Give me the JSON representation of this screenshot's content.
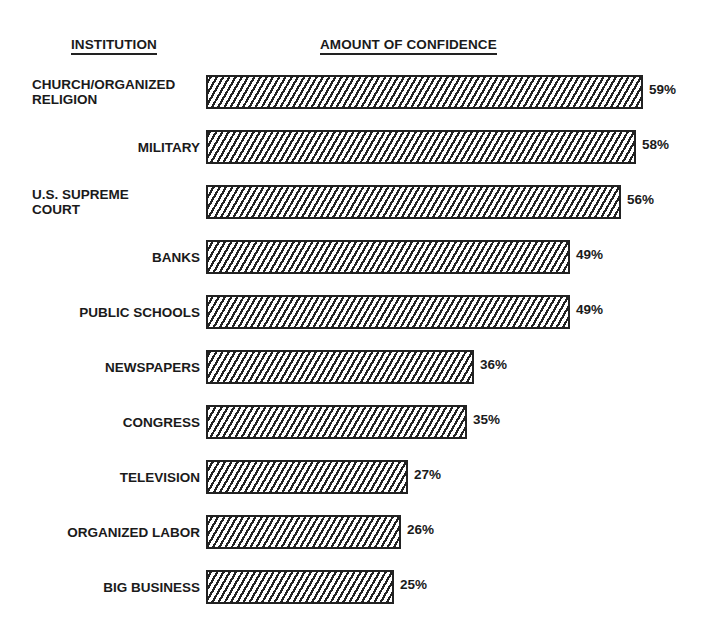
{
  "headers": {
    "institution": "INSTITUTION",
    "amount": "AMOUNT OF CONFIDENCE"
  },
  "rows": [
    {
      "label_lines": [
        "CHURCH/ORGANIZED",
        "RELIGION"
      ],
      "value": 59,
      "value_label": "59%"
    },
    {
      "label_lines": [
        "MILITARY"
      ],
      "value": 58,
      "value_label": "58%"
    },
    {
      "label_lines": [
        "U.S. SUPREME",
        "COURT"
      ],
      "value": 56,
      "value_label": "56%"
    },
    {
      "label_lines": [
        "BANKS"
      ],
      "value": 49,
      "value_label": "49%"
    },
    {
      "label_lines": [
        "PUBLIC SCHOOLS"
      ],
      "value": 49,
      "value_label": "49%"
    },
    {
      "label_lines": [
        "NEWSPAPERS"
      ],
      "value": 36,
      "value_label": "36%"
    },
    {
      "label_lines": [
        "CONGRESS"
      ],
      "value": 35,
      "value_label": "35%"
    },
    {
      "label_lines": [
        "TELEVISION"
      ],
      "value": 27,
      "value_label": "27%"
    },
    {
      "label_lines": [
        "ORGANIZED LABOR"
      ],
      "value": 26,
      "value_label": "26%"
    },
    {
      "label_lines": [
        "BIG BUSINESS"
      ],
      "value": 25,
      "value_label": "25%"
    }
  ],
  "chart_data": {
    "type": "bar",
    "orientation": "horizontal",
    "title": "",
    "xlabel": "AMOUNT OF CONFIDENCE",
    "ylabel": "INSTITUTION",
    "categories": [
      "CHURCH/ORGANIZED RELIGION",
      "MILITARY",
      "U.S. SUPREME COURT",
      "BANKS",
      "PUBLIC SCHOOLS",
      "NEWSPAPERS",
      "CONGRESS",
      "TELEVISION",
      "ORGANIZED LABOR",
      "BIG BUSINESS"
    ],
    "values": [
      59,
      58,
      56,
      49,
      49,
      36,
      35,
      27,
      26,
      25
    ],
    "value_labels": [
      "59%",
      "58%",
      "56%",
      "49%",
      "49%",
      "36%",
      "35%",
      "27%",
      "26%",
      "25%"
    ],
    "unit": "%",
    "grid": false,
    "legend": null,
    "bar_fill": "diagonal hatch, black on white"
  }
}
